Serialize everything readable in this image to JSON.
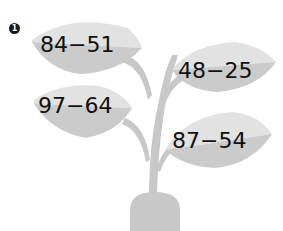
{
  "problem_number": "1",
  "colors": {
    "leaf_light": "#e2e2e2",
    "leaf_dark": "#c9c9c9",
    "stem": "#c8c8c8",
    "text": "#111111",
    "badge": "#1a1a1a"
  },
  "leaves": [
    {
      "position": "top-left",
      "expression": "84−51"
    },
    {
      "position": "top-right",
      "expression": "48−25"
    },
    {
      "position": "mid-left",
      "expression": "97−64"
    },
    {
      "position": "bottom-right",
      "expression": "87−54"
    }
  ]
}
